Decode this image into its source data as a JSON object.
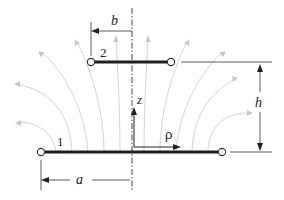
{
  "diagram": {
    "labels": {
      "disk_upper": "2",
      "disk_lower": "1",
      "dim_b": "b",
      "dim_a": "a",
      "dim_h": "h",
      "axis_z": "z",
      "axis_rho": "ρ"
    },
    "colors": {
      "disk": "#1f1f1f",
      "field_lines": "#cfcfcf",
      "dimension_lines": "#333333",
      "background": "#ffffff"
    },
    "elements": {
      "upper_disk": {
        "name": "2",
        "radius_label": "b"
      },
      "lower_disk": {
        "name": "1",
        "radius_label": "a"
      },
      "separation_label": "h",
      "coordinate_axes": [
        "z",
        "ρ"
      ]
    }
  }
}
